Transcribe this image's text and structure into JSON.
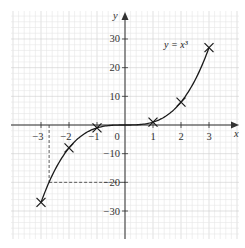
{
  "chart_data": {
    "type": "line",
    "title": "",
    "xlabel": "x",
    "ylabel": "y",
    "xlim": [
      -3.25,
      3.9
    ],
    "ylim": [
      -40,
      39
    ],
    "grid": true,
    "x_ticks": [
      -3,
      -2,
      -1,
      1,
      2,
      3
    ],
    "x_tick_labels": [
      "−3",
      "−2",
      "−1",
      "1",
      "2",
      "3"
    ],
    "y_ticks": [
      -30,
      -20,
      -10,
      10,
      20,
      30
    ],
    "y_tick_labels": [
      "−30",
      "−20",
      "−10",
      "10",
      "20",
      "30"
    ],
    "origin_label": "0",
    "series": [
      {
        "name": "y = x³",
        "label_text": "y = x³",
        "function": "x^3",
        "marked_points": [
          {
            "x": -3,
            "y": -27
          },
          {
            "x": -2,
            "y": -8
          },
          {
            "x": -1,
            "y": -1
          },
          {
            "x": 1,
            "y": 1
          },
          {
            "x": 2,
            "y": 8
          },
          {
            "x": 3,
            "y": 27
          }
        ]
      }
    ],
    "annotations": [
      {
        "type": "dashed-guide",
        "description": "reading x where y = -20",
        "x": -2.71,
        "y": -20
      }
    ]
  }
}
